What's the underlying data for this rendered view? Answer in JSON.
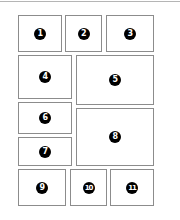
{
  "diagram": {
    "type": "panel-layout",
    "panels": [
      {
        "label": "1"
      },
      {
        "label": "2"
      },
      {
        "label": "3"
      },
      {
        "label": "4"
      },
      {
        "label": "5"
      },
      {
        "label": "6"
      },
      {
        "label": "7"
      },
      {
        "label": "8"
      },
      {
        "label": "9"
      },
      {
        "label": "10"
      },
      {
        "label": "11"
      }
    ]
  }
}
